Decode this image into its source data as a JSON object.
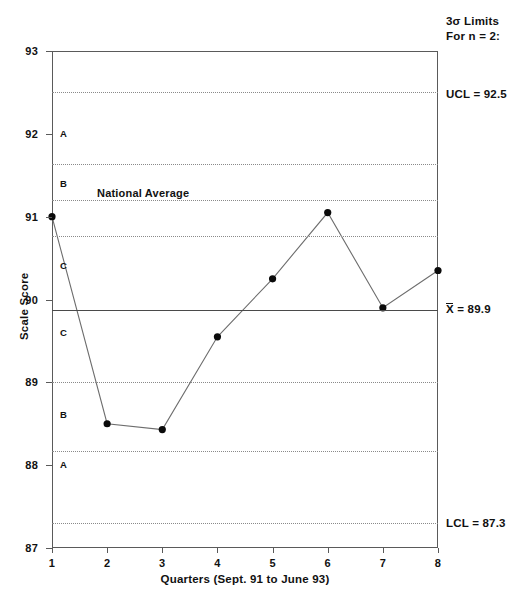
{
  "chart_data": {
    "type": "line",
    "title": "",
    "subtitle": "",
    "xlabel": "Quarters (Sept. 91 to June 93)",
    "ylabel": "Scale Score",
    "x": [
      1,
      2,
      3,
      4,
      5,
      6,
      7,
      8
    ],
    "categories": [
      "1",
      "2",
      "3",
      "4",
      "5",
      "6",
      "7",
      "8"
    ],
    "series": [
      {
        "name": "Scale Score",
        "values": [
          91.0,
          88.5,
          88.43,
          89.55,
          90.25,
          91.05,
          89.9,
          90.35
        ]
      }
    ],
    "ylim": [
      87,
      93
    ],
    "xlim": [
      1,
      8
    ],
    "ytick_labels": [
      "93",
      "92",
      "91",
      "90",
      "89",
      "88",
      "87"
    ],
    "ytick_values": [
      93,
      92,
      91,
      90,
      89,
      88,
      87
    ],
    "xtick_labels": [
      "1",
      "2",
      "3",
      "4",
      "5",
      "6",
      "7",
      "8"
    ],
    "grid": "horizontal-dotted",
    "legend": "none",
    "marker": "filled-circle",
    "control_limits": {
      "ucl_value": 92.5,
      "ucl_label": "UCL = 92.5",
      "center_value": 89.9,
      "center_label": "X = 89.9",
      "center_label_symbol": "X",
      "center_label_rest": " = 89.9",
      "lcl_value": 87.3,
      "lcl_label": "LCL = 87.3"
    },
    "sigma_note": {
      "line1": "3σ  Limits",
      "line2": "For  n = 2:"
    },
    "annotations": [
      {
        "text": "National Average",
        "value": 91.2
      }
    ],
    "zone_lines": [
      {
        "value": 92.5,
        "style": "dotted"
      },
      {
        "value": 91.633,
        "style": "dotted"
      },
      {
        "value": 91.2,
        "style": "dotted"
      },
      {
        "value": 90.767,
        "style": "dotted"
      },
      {
        "value": 89.0,
        "style": "dotted"
      },
      {
        "value": 88.167,
        "style": "dotted"
      },
      {
        "value": 87.3,
        "style": "dotted"
      }
    ],
    "zone_letters": [
      {
        "label": "A",
        "value": 92.0
      },
      {
        "label": "B",
        "value": 91.4
      },
      {
        "label": "C",
        "value": 90.4
      },
      {
        "label": "C",
        "value": 89.6
      },
      {
        "label": "B",
        "value": 88.6
      },
      {
        "label": "A",
        "value": 88.0
      }
    ],
    "colors": {
      "line": "#6d6d6d",
      "marker": "#0b0b0b",
      "grid": "#8a8a8a",
      "center": "#4a4a4a",
      "frame": "#5a5a5a",
      "text": "#111111"
    }
  }
}
